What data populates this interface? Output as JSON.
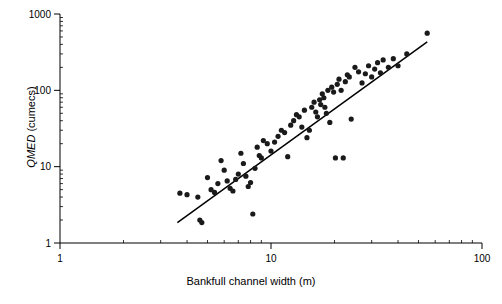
{
  "chart_data": {
    "type": "scatter",
    "title": "",
    "subtitle": "",
    "xlabel": "Bankfull channel width (m)",
    "ylabel_italic": "QMED",
    "ylabel_rest": " (cumecs)",
    "ylabel": "QMED (cumecs)",
    "xscale": "log",
    "yscale": "log",
    "xlim": [
      1,
      100
    ],
    "ylim": [
      1,
      1000
    ],
    "xticks": [
      1,
      10,
      100
    ],
    "xticklabels": [
      "1",
      "10",
      "100"
    ],
    "yticks": [
      1,
      10,
      100,
      1000
    ],
    "yticklabels": [
      "1",
      "10",
      "100",
      "1000"
    ],
    "grid": false,
    "legend": null,
    "marker": {
      "shape": "circle",
      "color": "#1a1a1a",
      "size": 4
    },
    "trendline": {
      "name": "power-law regression",
      "color": "#000000",
      "width": 1.5,
      "x_start": 3.6,
      "y_start": 1.85,
      "x_end": 55.0,
      "y_end": 430.0
    },
    "x": [
      3.7,
      4.0,
      4.5,
      4.6,
      4.7,
      5.0,
      5.2,
      5.4,
      5.6,
      5.8,
      6.0,
      6.2,
      6.4,
      6.6,
      6.8,
      7.0,
      7.2,
      7.4,
      7.6,
      7.8,
      8.0,
      8.2,
      8.4,
      8.6,
      8.8,
      9.0,
      9.2,
      9.6,
      10.0,
      10.4,
      10.8,
      11.2,
      11.6,
      12.0,
      12.4,
      12.8,
      13.2,
      13.6,
      14.0,
      14.4,
      14.8,
      15.2,
      15.6,
      16.0,
      16.3,
      16.6,
      17.0,
      17.2,
      17.5,
      17.8,
      18.0,
      18.3,
      18.6,
      19.0,
      19.4,
      19.8,
      20.2,
      20.6,
      21.0,
      21.5,
      22.0,
      22.5,
      23.0,
      23.5,
      24.0,
      25.0,
      26.0,
      27.0,
      28.0,
      29.0,
      30.0,
      31.0,
      32.0,
      33.0,
      34.0,
      36.0,
      38.0,
      40.0,
      44.0,
      55.0
    ],
    "y": [
      4.5,
      4.3,
      4.0,
      2.0,
      1.85,
      7.2,
      5.0,
      4.6,
      6.0,
      12.0,
      9.0,
      6.5,
      5.2,
      4.8,
      6.8,
      8.0,
      15.0,
      11.0,
      7.5,
      5.5,
      6.2,
      2.4,
      9.5,
      18.0,
      14.0,
      13.0,
      22.0,
      20.0,
      16.0,
      21.0,
      25.0,
      30.0,
      28.0,
      13.5,
      35.0,
      40.0,
      48.0,
      45.0,
      33.0,
      55.0,
      24.0,
      30.0,
      60.0,
      70.0,
      52.0,
      45.0,
      75.0,
      65.0,
      90.0,
      80.0,
      60.0,
      50.0,
      100.0,
      38.0,
      110.0,
      95.0,
      13.0,
      120.0,
      140.0,
      100.0,
      13.0,
      130.0,
      160.0,
      150.0,
      42.0,
      200.0,
      175.0,
      125.0,
      165.0,
      210.0,
      150.0,
      190.0,
      230.0,
      170.0,
      250.0,
      200.0,
      260.0,
      210.0,
      300.0,
      560.0
    ]
  }
}
